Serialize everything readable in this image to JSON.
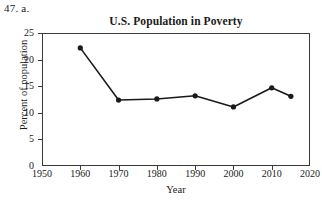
{
  "problem": {
    "number_label": "47. a."
  },
  "chart_data": {
    "type": "line",
    "title": "U.S. Population in Poverty",
    "xlabel": "Year",
    "ylabel": "Percent of population",
    "x": [
      1960,
      1970,
      1980,
      1990,
      2000,
      2010,
      2015
    ],
    "values": [
      22.2,
      12.4,
      12.6,
      13.2,
      11.1,
      14.7,
      13.1
    ],
    "xlim": [
      1950,
      2020
    ],
    "ylim": [
      0,
      25
    ],
    "xticks": [
      1950,
      1960,
      1970,
      1980,
      1990,
      2000,
      2010,
      2020
    ],
    "xtick_labels": [
      "1950",
      "1960",
      "1970",
      "1980",
      "1990",
      "2000",
      "2010",
      "2020"
    ],
    "yticks": [
      0,
      5,
      10,
      15,
      20,
      25
    ],
    "ytick_labels": [
      "0",
      "5",
      "10",
      "15",
      "20",
      "25"
    ],
    "grid": false,
    "legend": false,
    "marker": "filled-circle",
    "line_color": "#1a1a1a",
    "marker_color": "#1a1a1a",
    "frame_color": "#3a3a3a",
    "background": "#ffffff"
  }
}
